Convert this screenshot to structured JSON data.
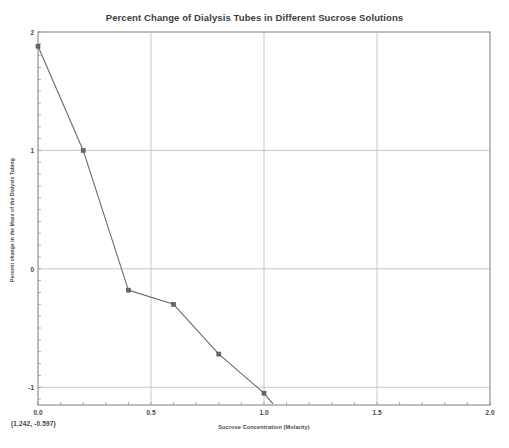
{
  "chart_data": {
    "type": "line",
    "title": "Percent Change of Dialysis Tubes in Different Sucrose Solutions",
    "xlabel": "Sucrose Concentration (Molarity)",
    "ylabel": "Percent change in the Mass of the Dialysis Tubing",
    "xlim": [
      0.0,
      2.0
    ],
    "ylim": [
      -1.15,
      2.0
    ],
    "grid": true,
    "legend": null,
    "x_ticks": [
      {
        "value": 0.0,
        "label": "0.0"
      },
      {
        "value": 0.5,
        "label": "0.5"
      },
      {
        "value": 1.0,
        "label": "1.0"
      },
      {
        "value": 1.5,
        "label": "1.5"
      },
      {
        "value": 2.0,
        "label": "2.0"
      }
    ],
    "x_minor_tick_step": 0.1,
    "y_ticks": [
      {
        "value": 2,
        "label": "2"
      },
      {
        "value": 1,
        "label": "1"
      },
      {
        "value": 0,
        "label": "0"
      },
      {
        "value": -1,
        "label": "-1"
      }
    ],
    "y_minor_tick_step": 0.1,
    "series": [
      {
        "name": "Percent change in mass",
        "marker": "square",
        "color": "#6b6b6b",
        "x": [
          0.0,
          0.2,
          0.4,
          0.6,
          0.8,
          1.0,
          1.04
        ],
        "values": [
          1.88,
          1.0,
          -0.18,
          -0.3,
          -0.72,
          -1.05,
          -1.14
        ]
      }
    ],
    "annotations": [
      {
        "name": "cursor-coordinates",
        "text": "(1.242, -0.597)"
      }
    ]
  }
}
